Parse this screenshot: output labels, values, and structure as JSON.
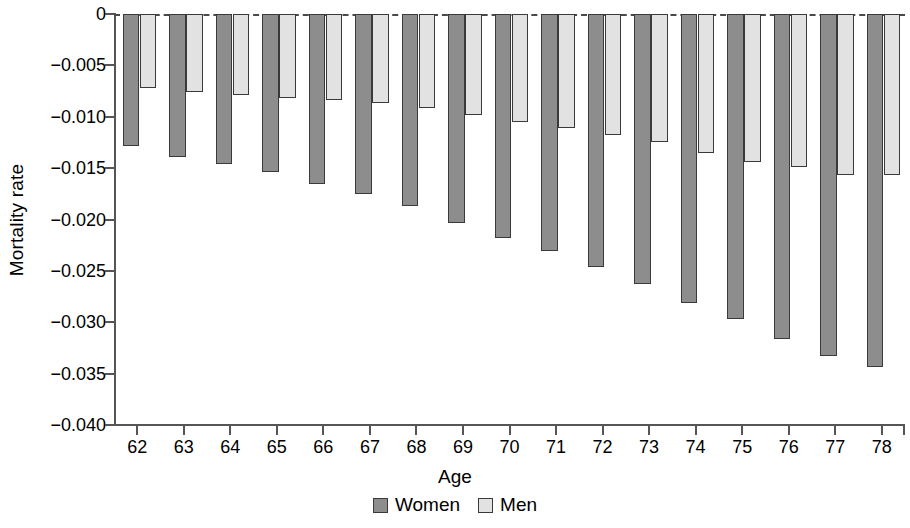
{
  "chart_data": {
    "type": "bar",
    "title": "",
    "xlabel": "Age",
    "ylabel": "Mortality rate",
    "categories": [
      "62",
      "63",
      "64",
      "65",
      "66",
      "67",
      "68",
      "69",
      "70",
      "71",
      "72",
      "73",
      "74",
      "75",
      "76",
      "77",
      "78"
    ],
    "series": [
      {
        "name": "Women",
        "color": "#8d8d8d",
        "values": [
          -0.0128,
          -0.0139,
          -0.0146,
          -0.0154,
          -0.0165,
          -0.0175,
          -0.0187,
          -0.0203,
          -0.0218,
          -0.0231,
          -0.0246,
          -0.0263,
          -0.0281,
          -0.0297,
          -0.0316,
          -0.0333,
          -0.0344
        ]
      },
      {
        "name": "Men",
        "color": "#e2e2e2",
        "values": [
          -0.0072,
          -0.0076,
          -0.0079,
          -0.0082,
          -0.0084,
          -0.0087,
          -0.0091,
          -0.0098,
          -0.0105,
          -0.0111,
          -0.0118,
          -0.0125,
          -0.0135,
          -0.0144,
          -0.0149,
          -0.0157,
          -0.0157
        ]
      }
    ],
    "ylim": [
      -0.04,
      0.0
    ],
    "yticks": [
      0,
      -0.005,
      -0.01,
      -0.015,
      -0.02,
      -0.025,
      -0.03,
      -0.035,
      -0.04
    ],
    "ytick_labels": [
      "0",
      "−0.005",
      "−0.010",
      "−0.015",
      "−0.020",
      "−0.025",
      "−0.030",
      "−0.035",
      "−0.040"
    ],
    "grid": false,
    "zero_line": true,
    "legend_position": "bottom-center"
  },
  "legend": {
    "items": [
      {
        "label": "Women"
      },
      {
        "label": "Men"
      }
    ]
  }
}
